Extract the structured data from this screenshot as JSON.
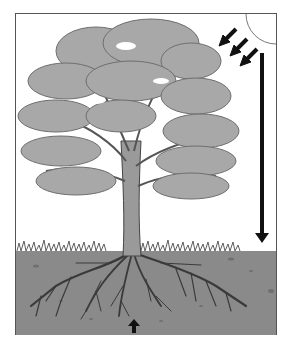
{
  "diagram": {
    "title": "",
    "elements": [
      {
        "id": "sun",
        "label": "",
        "icon": "sun-icon"
      },
      {
        "id": "sunlight-arrows",
        "label": "",
        "count": 3,
        "direction": "down-left"
      },
      {
        "id": "water-arrow",
        "label": "",
        "direction": "down"
      },
      {
        "id": "tree-canopy",
        "label": ""
      },
      {
        "id": "tree-trunk",
        "label": ""
      },
      {
        "id": "grass",
        "label": ""
      },
      {
        "id": "soil",
        "label": ""
      },
      {
        "id": "roots",
        "label": ""
      },
      {
        "id": "nutrient-arrow",
        "label": "",
        "direction": "up"
      }
    ],
    "colors": {
      "frame": "#555555",
      "canopy": "#a8a8a8",
      "canopy_shadow": "#8e8e8e",
      "trunk": "#9a9a9a",
      "soil": "#8a8a8a",
      "roots": "#3a3a3a",
      "arrows": "#111111",
      "grass": "#6e6e6e"
    }
  }
}
